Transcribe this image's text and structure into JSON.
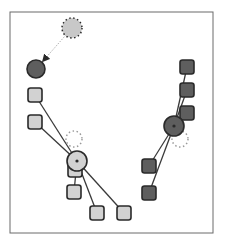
{
  "diagram": {
    "type": "k-means clustering iteration",
    "colors": {
      "frame": "#6a6a6a",
      "light_fill": "#d2d2d2",
      "dark_fill": "#5e5e5e",
      "stroke": "#2a2a2a",
      "ghost_light_fill": "#c8c8c8",
      "ghost_dark_stroke": "#9a9a9a",
      "arrow": "#9a9a9a",
      "link": "#3a3a3a"
    },
    "frame": {
      "x": 10,
      "y": 12,
      "w": 203,
      "h": 221
    },
    "clusters": [
      {
        "name": "light-cluster",
        "centroid": {
          "x": 77,
          "y": 161,
          "r": 10
        },
        "previous_centroid": {
          "x": 74,
          "y": 139,
          "r": 8
        },
        "points": [
          {
            "x": 35,
            "y": 95
          },
          {
            "x": 35,
            "y": 122
          },
          {
            "x": 75,
            "y": 170
          },
          {
            "x": 74,
            "y": 192
          },
          {
            "x": 97,
            "y": 213
          },
          {
            "x": 124,
            "y": 213
          }
        ]
      },
      {
        "name": "dark-cluster",
        "centroid": {
          "x": 174,
          "y": 126,
          "r": 10
        },
        "previous_centroid": {
          "x": 180,
          "y": 139,
          "r": 8
        },
        "points": [
          {
            "x": 187,
            "y": 67
          },
          {
            "x": 187,
            "y": 90
          },
          {
            "x": 187,
            "y": 113
          },
          {
            "x": 149,
            "y": 166
          },
          {
            "x": 149,
            "y": 193
          }
        ]
      }
    ],
    "moving_centroid": {
      "from": {
        "x": 72,
        "y": 28,
        "r": 10
      },
      "to": {
        "x": 36,
        "y": 69,
        "r": 9
      }
    }
  }
}
